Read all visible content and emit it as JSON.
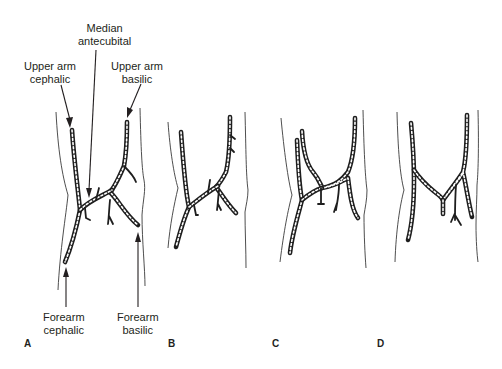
{
  "figure": {
    "labels": {
      "median_antecubital": [
        "Median",
        "antecubital"
      ],
      "upper_arm_cephalic": [
        "Upper arm",
        "cephalic"
      ],
      "upper_arm_basilic": [
        "Upper arm",
        "basilic"
      ],
      "forearm_cephalic": [
        "Forearm",
        "cephalic"
      ],
      "forearm_basilic": [
        "Forearm",
        "basilic"
      ]
    },
    "panels": [
      {
        "id": "A"
      },
      {
        "id": "B"
      },
      {
        "id": "C"
      },
      {
        "id": "D"
      }
    ],
    "colors": {
      "ink": "#231f20",
      "background": "#ffffff"
    }
  }
}
